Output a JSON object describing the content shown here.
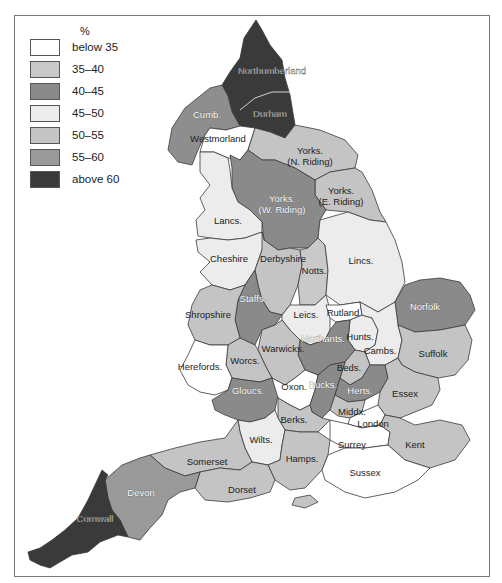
{
  "legend": {
    "title": "%",
    "items": [
      {
        "label": "below 35",
        "color": "#ffffff"
      },
      {
        "label": "35–40",
        "color": "#c9c9c9"
      },
      {
        "label": "40–45",
        "color": "#8a8a8a"
      },
      {
        "label": "45–50",
        "color": "#ececec"
      },
      {
        "label": "50–55",
        "color": "#c4c4c4"
      },
      {
        "label": "55–60",
        "color": "#9a9a9a"
      },
      {
        "label": "above 60",
        "color": "#3a3a3a"
      }
    ]
  },
  "counties": {
    "northumberland": {
      "name": "Northumberland",
      "band": "above 60"
    },
    "durham": {
      "name": "Durham",
      "band": "above 60"
    },
    "cumb": {
      "name": "Cumb.",
      "band": "55–60"
    },
    "westmorland": {
      "name": "Westmorland",
      "band": "below 35"
    },
    "yorks_n": {
      "name": "Yorks.",
      "name2": "(N. Riding)",
      "band": "50–55"
    },
    "yorks_e": {
      "name": "Yorks.",
      "name2": "(E. Riding)",
      "band": "50–55"
    },
    "yorks_w": {
      "name": "Yorks.",
      "name2": "(W. Riding)",
      "band": "40–45"
    },
    "lancs": {
      "name": "Lancs.",
      "band": "45–50"
    },
    "cheshire": {
      "name": "Cheshire",
      "band": "45–50"
    },
    "derbyshire": {
      "name": "Derbyshire",
      "band": "50–55"
    },
    "notts": {
      "name": "Notts.",
      "band": "35–40"
    },
    "lincs": {
      "name": "Lincs.",
      "band": "45–50"
    },
    "staffs": {
      "name": "Staffs.",
      "band": "40–45"
    },
    "shropshire": {
      "name": "Shropshire",
      "band": "50–55"
    },
    "leics": {
      "name": "Leics.",
      "band": "45–50"
    },
    "rutland": {
      "name": "Rutland",
      "band": "below 35"
    },
    "norfolk": {
      "name": "Norfolk",
      "band": "40–45"
    },
    "hunts": {
      "name": "Hunts.",
      "band": "45–50"
    },
    "cambs": {
      "name": "Cambs.",
      "band": "45–50"
    },
    "suffolk": {
      "name": "Suffolk",
      "band": "50–55"
    },
    "northants": {
      "name": "Northants.",
      "band": "40–45"
    },
    "warwicks": {
      "name": "Warwicks.",
      "band": "50–55"
    },
    "worcs": {
      "name": "Worcs.",
      "band": "50–55"
    },
    "herefords": {
      "name": "Herefords.",
      "band": "below 35"
    },
    "beds": {
      "name": "Beds.",
      "band": "50–55"
    },
    "glous": {
      "name": "Gloucs.",
      "band": "40–45"
    },
    "oxon": {
      "name": "Oxon.",
      "band": "below 35"
    },
    "bucks": {
      "name": "Bucks.",
      "band": "40–45"
    },
    "herts": {
      "name": "Herts.",
      "band": "40–45"
    },
    "essex": {
      "name": "Essex",
      "band": "50–55"
    },
    "middx": {
      "name": "Middx.",
      "band": "50–55"
    },
    "london": {
      "name": "London",
      "band": "below 35"
    },
    "berks": {
      "name": "Berks.",
      "band": "50–55"
    },
    "wilts": {
      "name": "Wilts.",
      "band": "45–50"
    },
    "surrey": {
      "name": "Surrey",
      "band": "below 35"
    },
    "kent": {
      "name": "Kent",
      "band": "50–55"
    },
    "somerset": {
      "name": "Somerset",
      "band": "50–55"
    },
    "hamps": {
      "name": "Hamps.",
      "band": "50–55"
    },
    "sussex": {
      "name": "Sussex",
      "band": "below 35"
    },
    "dorset": {
      "name": "Dorset",
      "band": "50–55"
    },
    "devon": {
      "name": "Devon",
      "band": "55–60"
    },
    "cornwall": {
      "name": "Cornwall",
      "band": "above 60"
    }
  }
}
